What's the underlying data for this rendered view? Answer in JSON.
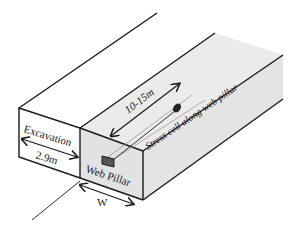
{
  "diagram": {
    "labels": {
      "excavation": "Excavation",
      "excavation_width": "2.9m",
      "web_pillar": "Web Pillar",
      "pillar_width": "W",
      "cell_length": "10-15m",
      "stress_cell": "Stress cell along web pillar"
    },
    "colors": {
      "line": "#1a1a1a",
      "pillar_fill": "#e6e6e6",
      "pillar_top_fill": "#ececec",
      "background": "#ffffff"
    }
  }
}
